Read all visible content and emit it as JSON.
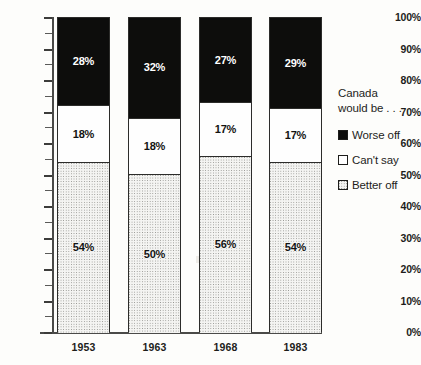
{
  "chart_data": {
    "type": "bar",
    "stacked": true,
    "title": "",
    "subtitle": "",
    "xlabel": "",
    "ylabel": "",
    "categories": [
      "1953",
      "1963",
      "1968",
      "1983"
    ],
    "series": [
      {
        "name": "Better off",
        "values": [
          54,
          50,
          56,
          54
        ],
        "pattern": "dotted",
        "color": "#f4f4f2"
      },
      {
        "name": "Can't say",
        "values": [
          18,
          18,
          17,
          17
        ],
        "pattern": "solid",
        "color": "#fefefe"
      },
      {
        "name": "Worse off",
        "values": [
          28,
          32,
          27,
          29
        ],
        "pattern": "solid",
        "color": "#0d0d0c"
      }
    ],
    "value_labels": [
      {
        "category": "1953",
        "worse_off": "28%",
        "cant_say": "18%",
        "better_off": "54%"
      },
      {
        "category": "1963",
        "worse_off": "32%",
        "cant_say": "18%",
        "better_off": "50%"
      },
      {
        "category": "1968",
        "worse_off": "27%",
        "cant_say": "17%",
        "better_off": "56%"
      },
      {
        "category": "1983",
        "worse_off": "29%",
        "cant_say": "17%",
        "better_off": "54%"
      }
    ],
    "ylim": [
      0,
      100
    ],
    "ytick_step": 10,
    "ytick_labels": [
      "100%",
      "90%",
      "80%",
      "70%",
      "60%",
      "50%",
      "40%",
      "30%",
      "20%",
      "10%",
      "0%"
    ],
    "grid": false,
    "legend_position": "right"
  },
  "legend": {
    "title_line1": "Canada",
    "title_line2": "would be . . .",
    "entries": [
      {
        "label": "Worse off",
        "swatch": "black-square-icon"
      },
      {
        "label": "Can't say",
        "swatch": "white-square-icon"
      },
      {
        "label": "Better off",
        "swatch": "dotted-square-icon"
      }
    ]
  }
}
